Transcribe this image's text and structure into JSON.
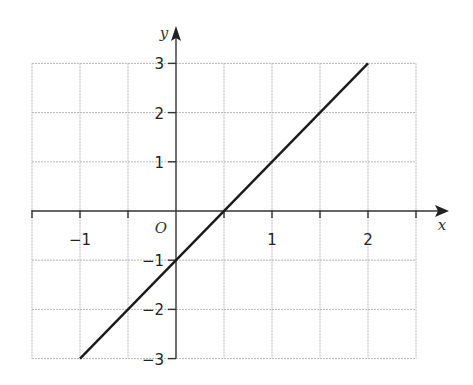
{
  "chart_data": {
    "type": "line",
    "title": "",
    "xlabel": "x",
    "ylabel": "y",
    "origin_label": "O",
    "xlim": [
      -1.5,
      2.5
    ],
    "ylim": [
      -3,
      3
    ],
    "grid": true,
    "grid_step_x": 0.5,
    "grid_step_y": 1,
    "x_ticks": [
      -1,
      1,
      2
    ],
    "x_tick_labels": [
      "−1",
      "1",
      "2"
    ],
    "y_ticks": [
      3,
      2,
      1,
      -1,
      -2,
      -3
    ],
    "y_tick_labels": [
      "3",
      "2",
      "1",
      "−1",
      "−2",
      "−3"
    ],
    "series": [
      {
        "name": "y = 2x − 1",
        "x": [
          -1,
          2
        ],
        "y": [
          -3,
          3
        ],
        "color": "#1a1a1a"
      }
    ]
  }
}
